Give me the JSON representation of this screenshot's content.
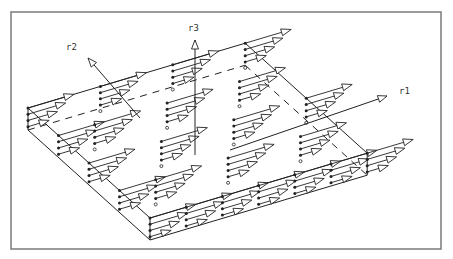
{
  "figure": {
    "frame": {
      "x": 11,
      "y": 12,
      "width": 430,
      "height": 237
    },
    "colors": {
      "line": "#222222",
      "frame": "#7a7a7a",
      "background": "#ffffff"
    },
    "plate": {
      "origin": [
        28,
        108
      ],
      "u_step": [
        36.2,
        -10.8
      ],
      "v_step": [
        30.5,
        27.5
      ],
      "cells_u": 6,
      "cells_v": 4,
      "thickness": 22,
      "layers": 4,
      "arrow_length": 48
    },
    "axes": [
      {
        "name": "r3",
        "label": "r3",
        "from": [
          195,
          155
        ],
        "to": [
          195,
          40
        ],
        "label_pos": [
          188,
          31
        ]
      },
      {
        "name": "r2",
        "label": "r2",
        "from": [
          140,
          118
        ],
        "to": [
          88,
          58
        ],
        "label_pos": [
          66,
          50
        ]
      },
      {
        "name": "r1",
        "label": "r1",
        "from": [
          230,
          150
        ],
        "to": [
          387,
          96
        ],
        "label_pos": [
          399,
          94
        ]
      }
    ]
  }
}
